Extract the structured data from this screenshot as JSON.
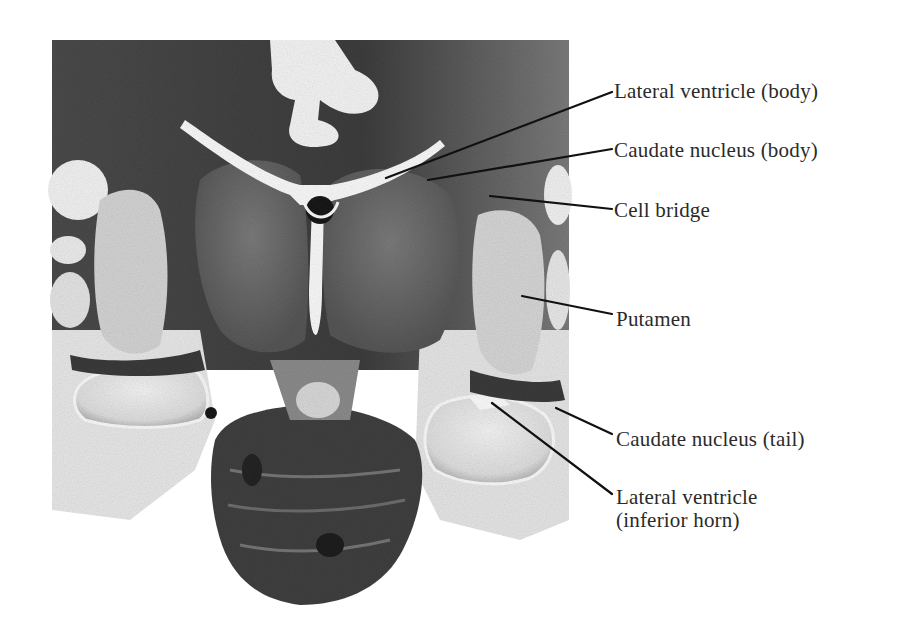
{
  "figure": {
    "type": "anatomical-section",
    "colors": {
      "background": "#ffffff",
      "tissue_dark": "#3a3a3a",
      "tissue_mid": "#6e6e6e",
      "tissue_light": "#c8c8c8",
      "ventricle": "#f4f4f4",
      "label_text": "#2a2a2a",
      "leader_line": "#111111"
    }
  },
  "labels": [
    {
      "id": "lateral-ventricle-body",
      "text": "Lateral ventricle (body)",
      "x": 614,
      "y": 80,
      "line": [
        386,
        178,
        612,
        92
      ]
    },
    {
      "id": "caudate-nucleus-body",
      "text": "Caudate nucleus (body)",
      "x": 614,
      "y": 139,
      "line": [
        428,
        180,
        612,
        149
      ]
    },
    {
      "id": "cell-bridge",
      "text": "Cell bridge",
      "x": 614,
      "y": 199,
      "line": [
        490,
        196,
        612,
        209
      ]
    },
    {
      "id": "putamen",
      "text": "Putamen",
      "x": 616,
      "y": 308,
      "line": [
        522,
        296,
        612,
        314
      ]
    },
    {
      "id": "caudate-nucleus-tail",
      "text": "Caudate nucleus (tail)",
      "x": 616,
      "y": 428,
      "line": [
        556,
        408,
        612,
        434
      ]
    },
    {
      "id": "lateral-ventricle-inferior-horn",
      "text": "Lateral ventricle\n(inferior horn)",
      "x": 616,
      "y": 486,
      "line": [
        492,
        403,
        612,
        494
      ]
    }
  ]
}
